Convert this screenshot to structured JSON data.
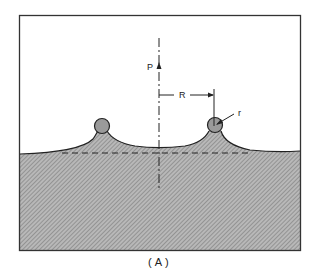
{
  "figure": {
    "caption": "(A)",
    "labels": {
      "force": "P",
      "radius_major": "R",
      "radius_minor": "r"
    },
    "colors": {
      "frame": "#333333",
      "fill": "#a9a9a9",
      "sphere": "#9a9a9a",
      "line": "#222222",
      "background": "#ffffff"
    },
    "elements": [
      "outer-frame",
      "liquid-region-hatched",
      "left-sphere",
      "right-sphere",
      "meniscus-surface",
      "center-axis-dash-dot",
      "reference-level-dashed",
      "force-arrow-P",
      "dimension-R",
      "leader-r"
    ]
  }
}
